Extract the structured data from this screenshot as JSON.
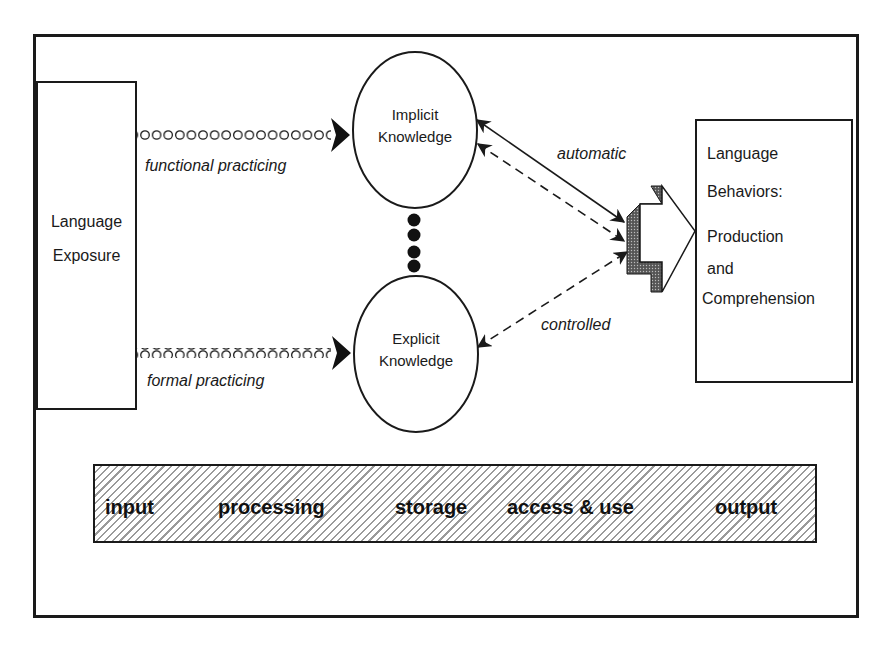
{
  "diagram": {
    "type": "flow-model",
    "nodes": {
      "exposure": {
        "lines": [
          "Language",
          "Exposure"
        ]
      },
      "implicit": {
        "lines": [
          "Implicit",
          "Knowledge"
        ]
      },
      "explicit": {
        "lines": [
          "Explicit",
          "Knowledge"
        ]
      },
      "behaviors": {
        "lines": [
          "Language",
          "Behaviors:",
          "Production",
          "and",
          "Comprehension"
        ]
      }
    },
    "edges": {
      "functional": {
        "label": "functional practicing",
        "from": "Language Exposure",
        "to": "Implicit Knowledge",
        "style": "chain"
      },
      "formal": {
        "label": "formal practicing",
        "from": "Language Exposure",
        "to": "Explicit Knowledge",
        "style": "chain"
      },
      "automatic": {
        "label": "automatic",
        "from": "Implicit Knowledge",
        "to": "Language Behaviors",
        "style": "solid + dashed bidirectional"
      },
      "controlled": {
        "label": "controlled",
        "from": "Explicit Knowledge",
        "to": "Language Behaviors",
        "style": "dashed bidirectional"
      },
      "interface": {
        "label": "",
        "from": "Implicit Knowledge",
        "to": "Explicit Knowledge",
        "style": "dots"
      }
    },
    "stages": [
      "input",
      "processing",
      "storage",
      "access & use",
      "output"
    ]
  }
}
